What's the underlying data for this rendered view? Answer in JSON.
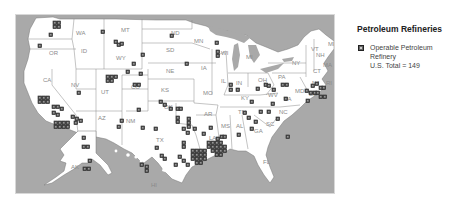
{
  "legend": {
    "title": "Petroleum Refineries",
    "marker_icon": "refinery-square-icon",
    "label_line1": "Operable Petroleum",
    "label_line2": "Refinery",
    "total_line": "U.S. Total = 149"
  },
  "map": {
    "background_color": "#a9a9a9",
    "land_color": "#ffffff",
    "marker_color": "#555555",
    "state_labels": [
      {
        "id": "WA",
        "x": 60,
        "y": 20
      },
      {
        "id": "OR",
        "x": 33,
        "y": 40
      },
      {
        "id": "CA",
        "x": 27,
        "y": 67
      },
      {
        "id": "ID",
        "x": 65,
        "y": 38
      },
      {
        "id": "NV",
        "x": 55,
        "y": 72
      },
      {
        "id": "MT",
        "x": 105,
        "y": 17
      },
      {
        "id": "WY",
        "x": 100,
        "y": 45
      },
      {
        "id": "UT",
        "x": 85,
        "y": 79
      },
      {
        "id": "AZ",
        "x": 82,
        "y": 105
      },
      {
        "id": "CO",
        "x": 115,
        "y": 74
      },
      {
        "id": "NM",
        "x": 110,
        "y": 108
      },
      {
        "id": "ND",
        "x": 155,
        "y": 20
      },
      {
        "id": "SD",
        "x": 150,
        "y": 37
      },
      {
        "id": "NE",
        "x": 150,
        "y": 58
      },
      {
        "id": "KS",
        "x": 145,
        "y": 77
      },
      {
        "id": "OK",
        "x": 148,
        "y": 94
      },
      {
        "id": "TX",
        "x": 140,
        "y": 127
      },
      {
        "id": "MN",
        "x": 178,
        "y": 28
      },
      {
        "id": "IA",
        "x": 185,
        "y": 55
      },
      {
        "id": "MO",
        "x": 187,
        "y": 80
      },
      {
        "id": "AR",
        "x": 188,
        "y": 101
      },
      {
        "id": "LA",
        "x": 193,
        "y": 125
      },
      {
        "id": "WI",
        "x": 205,
        "y": 40
      },
      {
        "id": "IL",
        "x": 205,
        "y": 68
      },
      {
        "id": "MI",
        "x": 230,
        "y": 44
      },
      {
        "id": "IN",
        "x": 220,
        "y": 70
      },
      {
        "id": "OH",
        "x": 242,
        "y": 67
      },
      {
        "id": "KY",
        "x": 225,
        "y": 85
      },
      {
        "id": "TN",
        "x": 222,
        "y": 99
      },
      {
        "id": "MS",
        "x": 205,
        "y": 113
      },
      {
        "id": "AL",
        "x": 220,
        "y": 113
      },
      {
        "id": "GA",
        "x": 238,
        "y": 118
      },
      {
        "id": "FL",
        "x": 247,
        "y": 149
      },
      {
        "id": "SC",
        "x": 250,
        "y": 111
      },
      {
        "id": "NC",
        "x": 263,
        "y": 99
      },
      {
        "id": "VA",
        "x": 268,
        "y": 86
      },
      {
        "id": "WV",
        "x": 252,
        "y": 82
      },
      {
        "id": "PA",
        "x": 262,
        "y": 64
      },
      {
        "id": "NY",
        "x": 276,
        "y": 50
      },
      {
        "id": "VT",
        "x": 295,
        "y": 36
      },
      {
        "id": "NH",
        "x": 300,
        "y": 42
      },
      {
        "id": "ME",
        "x": 312,
        "y": 31
      },
      {
        "id": "MA",
        "x": 307,
        "y": 52
      },
      {
        "id": "CT",
        "x": 297,
        "y": 58
      },
      {
        "id": "NJ",
        "x": 296,
        "y": 70
      },
      {
        "id": "RI",
        "x": 310,
        "y": 70
      },
      {
        "id": "DE",
        "x": 293,
        "y": 81
      },
      {
        "id": "MD",
        "x": 279,
        "y": 78
      },
      {
        "id": "AK",
        "x": 55,
        "y": 154
      },
      {
        "id": "HI",
        "x": 135,
        "y": 172
      }
    ],
    "refineries": [
      [
        37,
        6
      ],
      [
        41,
        6
      ],
      [
        37,
        10
      ],
      [
        41,
        10
      ],
      [
        33,
        18
      ],
      [
        22,
        29
      ],
      [
        85,
        15
      ],
      [
        98,
        25
      ],
      [
        101,
        28
      ],
      [
        104,
        27
      ],
      [
        125,
        38
      ],
      [
        116,
        47
      ],
      [
        110,
        55
      ],
      [
        123,
        57
      ],
      [
        90,
        60
      ],
      [
        94,
        60
      ],
      [
        98,
        60
      ],
      [
        90,
        64
      ],
      [
        94,
        64
      ],
      [
        61,
        76
      ],
      [
        117,
        68
      ],
      [
        121,
        68
      ],
      [
        22,
        81
      ],
      [
        26,
        81
      ],
      [
        30,
        81
      ],
      [
        22,
        85
      ],
      [
        26,
        85
      ],
      [
        30,
        85
      ],
      [
        36,
        90
      ],
      [
        40,
        90
      ],
      [
        44,
        92
      ],
      [
        36,
        96
      ],
      [
        40,
        98
      ],
      [
        38,
        106
      ],
      [
        42,
        106
      ],
      [
        46,
        106
      ],
      [
        50,
        106
      ],
      [
        38,
        110
      ],
      [
        42,
        110
      ],
      [
        46,
        110
      ],
      [
        50,
        110
      ],
      [
        55,
        100
      ],
      [
        59,
        102
      ],
      [
        63,
        104
      ],
      [
        58,
        106
      ],
      [
        104,
        104
      ],
      [
        101,
        110
      ],
      [
        121,
        93
      ],
      [
        125,
        111
      ],
      [
        154,
        19
      ],
      [
        143,
        85
      ],
      [
        147,
        88
      ],
      [
        153,
        92
      ],
      [
        160,
        92
      ],
      [
        163,
        92
      ],
      [
        160,
        101
      ],
      [
        160,
        105
      ],
      [
        169,
        47
      ],
      [
        199,
        26
      ],
      [
        200,
        35
      ],
      [
        200,
        39
      ],
      [
        213,
        68
      ],
      [
        213,
        73
      ],
      [
        220,
        73
      ],
      [
        227,
        96
      ],
      [
        221,
        118
      ],
      [
        234,
        85
      ],
      [
        240,
        72
      ],
      [
        248,
        68
      ],
      [
        251,
        69
      ],
      [
        256,
        73
      ],
      [
        268,
        82
      ],
      [
        255,
        87
      ],
      [
        265,
        68
      ],
      [
        269,
        68
      ],
      [
        260,
        102
      ],
      [
        295,
        69
      ],
      [
        299,
        67
      ],
      [
        303,
        71
      ],
      [
        306,
        71
      ],
      [
        293,
        76
      ],
      [
        297,
        76
      ],
      [
        300,
        76
      ],
      [
        290,
        84
      ],
      [
        289,
        74
      ],
      [
        303,
        80
      ],
      [
        307,
        80
      ],
      [
        171,
        102
      ],
      [
        171,
        106
      ],
      [
        171,
        110
      ],
      [
        166,
        112
      ],
      [
        170,
        116
      ],
      [
        177,
        112
      ],
      [
        186,
        117
      ],
      [
        193,
        111
      ],
      [
        200,
        122
      ],
      [
        204,
        120
      ],
      [
        207,
        120
      ],
      [
        175,
        134
      ],
      [
        179,
        134
      ],
      [
        183,
        134
      ],
      [
        187,
        134
      ],
      [
        175,
        138
      ],
      [
        179,
        138
      ],
      [
        183,
        138
      ],
      [
        187,
        138
      ],
      [
        175,
        142
      ],
      [
        179,
        142
      ],
      [
        183,
        142
      ],
      [
        187,
        142
      ],
      [
        179,
        146
      ],
      [
        183,
        146
      ],
      [
        191,
        126
      ],
      [
        195,
        126
      ],
      [
        199,
        126
      ],
      [
        203,
        126
      ],
      [
        191,
        130
      ],
      [
        195,
        130
      ],
      [
        199,
        130
      ],
      [
        203,
        130
      ],
      [
        207,
        130
      ],
      [
        195,
        134
      ],
      [
        199,
        134
      ],
      [
        203,
        134
      ],
      [
        207,
        134
      ],
      [
        199,
        138
      ],
      [
        203,
        138
      ],
      [
        166,
        126
      ],
      [
        166,
        130
      ],
      [
        162,
        140
      ],
      [
        166,
        144
      ],
      [
        170,
        148
      ],
      [
        158,
        148
      ],
      [
        138,
        112
      ],
      [
        139,
        131
      ],
      [
        144,
        139
      ],
      [
        147,
        142
      ],
      [
        66,
        121
      ],
      [
        66,
        130
      ],
      [
        70,
        130
      ],
      [
        72,
        144
      ],
      [
        67,
        152
      ],
      [
        71,
        152
      ],
      [
        124,
        148
      ],
      [
        129,
        150
      ],
      [
        129,
        154
      ],
      [
        270,
        120
      ],
      [
        234,
        112
      ],
      [
        238,
        105
      ],
      [
        231,
        101
      ],
      [
        243,
        95
      ],
      [
        251,
        95
      ]
    ]
  }
}
